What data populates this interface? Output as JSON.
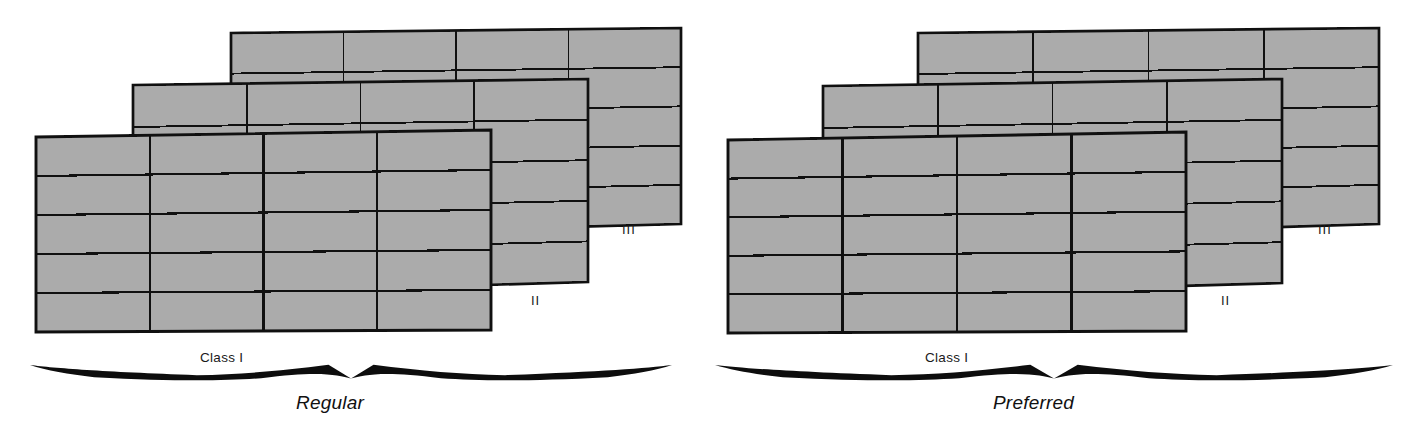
{
  "figure": {
    "title": "",
    "background_color": "#ffffff",
    "panel_count": 2
  },
  "style": {
    "cell_fill": "#ababab",
    "cell_stroke": "#101010",
    "text_color": "#1a1a1a",
    "swash_color": "#0d0d0d"
  },
  "panels": [
    {
      "id": "regular",
      "caption": "Regular",
      "class_label": "Class I",
      "layers": [
        {
          "numeral": "III",
          "label": "III",
          "columns": 4,
          "rows": 5,
          "depth": 3
        },
        {
          "numeral": "II",
          "label": "II",
          "columns": 4,
          "rows": 5,
          "depth": 2
        },
        {
          "numeral": "I",
          "label": "Class I",
          "columns": 4,
          "rows": 5,
          "depth": 1
        }
      ]
    },
    {
      "id": "preferred",
      "caption": "Preferred",
      "class_label": "Class I",
      "layers": [
        {
          "numeral": "III",
          "label": "III",
          "columns": 4,
          "rows": 5,
          "depth": 3
        },
        {
          "numeral": "II",
          "label": "II",
          "columns": 4,
          "rows": 5,
          "depth": 2
        },
        {
          "numeral": "I",
          "label": "Class I",
          "columns": 4,
          "rows": 5,
          "depth": 1
        }
      ]
    }
  ],
  "chart_data": {
    "type": "diagram",
    "title": "",
    "categories": [
      "Regular",
      "Preferred"
    ],
    "series": [
      {
        "name": "columns per sheet",
        "values": [
          4,
          4
        ]
      },
      {
        "name": "rows per sheet",
        "values": [
          5,
          5
        ]
      },
      {
        "name": "sheets per stack",
        "values": [
          3,
          3
        ]
      }
    ],
    "annotations": [
      "Class I",
      "II",
      "III",
      "Regular",
      "Preferred"
    ],
    "legend": [],
    "grid": true
  }
}
